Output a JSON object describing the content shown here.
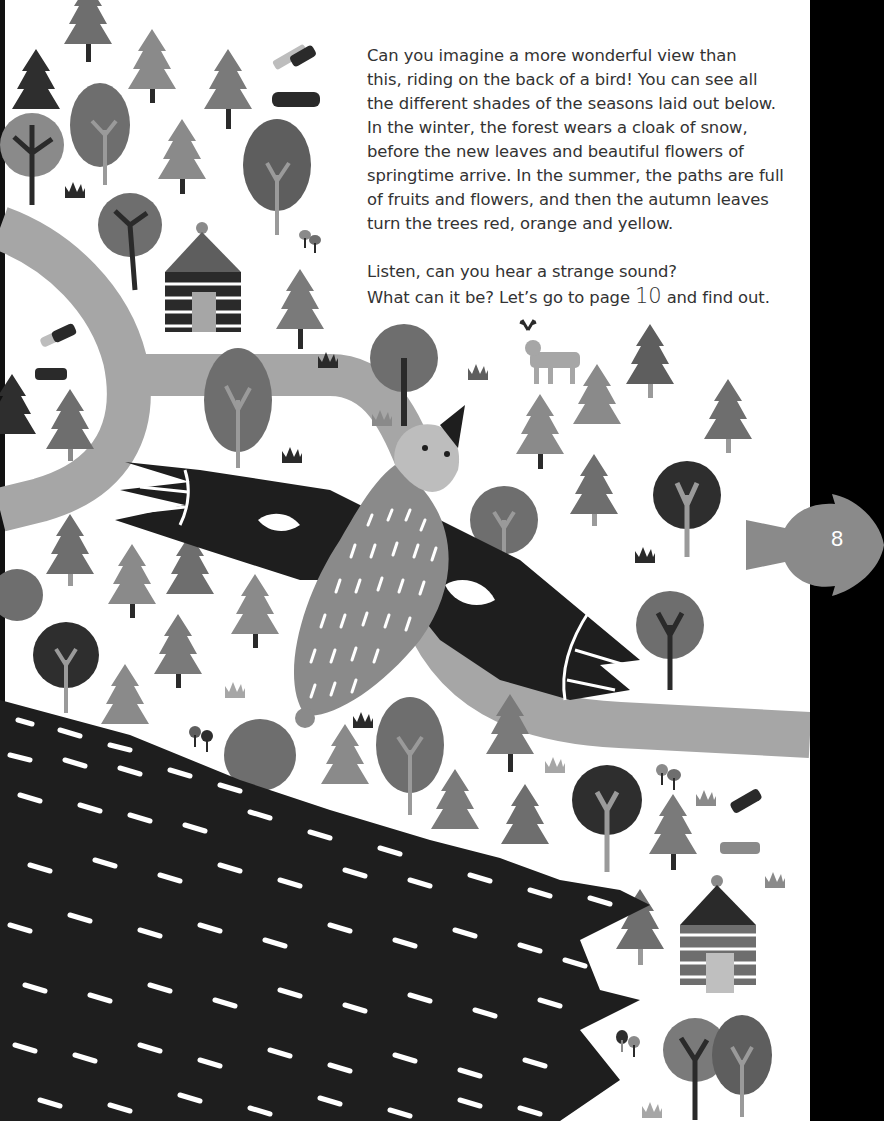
{
  "page": {
    "number": "8",
    "colors": {
      "background": "#ffffff",
      "ink_dark": "#2a2a2a",
      "tree_mid": "#6f6f6f",
      "tree_light": "#8c8c8c",
      "path": "#a6a6a6",
      "text": "#333333",
      "page_tab": "#8a8a8a",
      "gutter": "#000000"
    }
  },
  "story": {
    "paragraph1_lines": [
      "Can you imagine a more wonderful view than",
      "this, riding on the back of a bird! You can see all",
      "the different shades of the seasons laid out below.",
      "In the winter, the forest wears a cloak of snow,",
      "before the new leaves and beautiful flowers of",
      "springtime arrive. In the summer, the paths are full",
      "of fruits and flowers, and then the autumn leaves",
      "turn the trees red, orange and yellow."
    ],
    "paragraph2_line1": "Listen, can you hear a strange sound?",
    "paragraph2_line2_prefix": "What can it be? Let’s go to page ",
    "paragraph2_page_ref": "10",
    "paragraph2_line2_suffix": " and find out."
  },
  "illustration": {
    "subject": "bird flying over a forest with paths, cabins, a deer and a dark speckled hill",
    "elements": [
      "bird",
      "pine-trees",
      "round-trees",
      "cabins",
      "deer",
      "logs",
      "mushrooms",
      "grass-tufts",
      "path",
      "dark-hill"
    ]
  }
}
